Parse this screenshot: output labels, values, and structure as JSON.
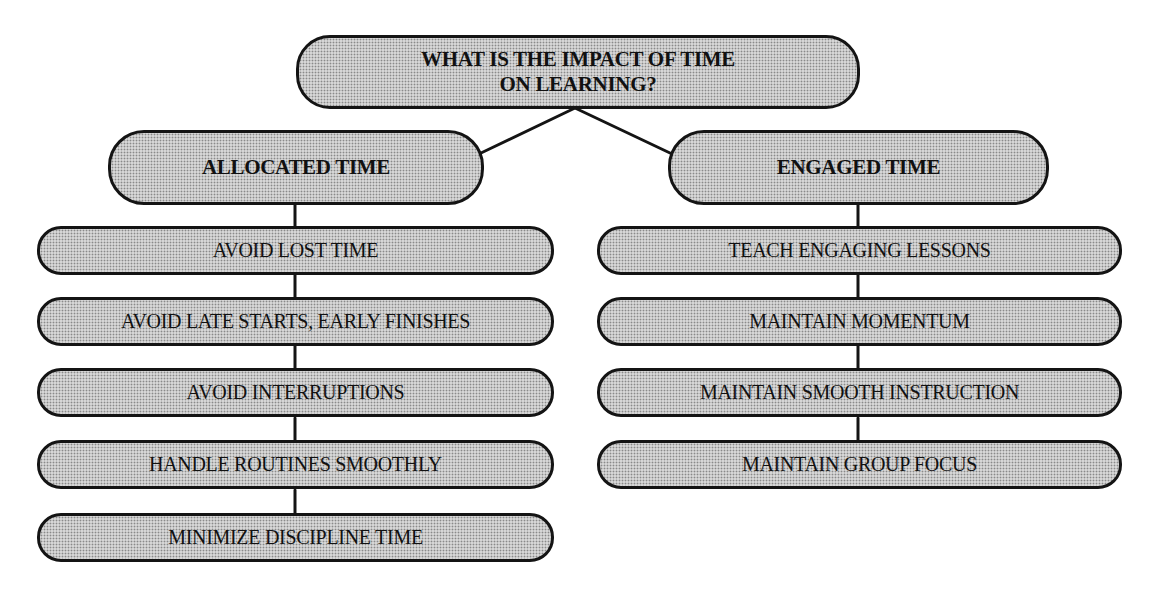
{
  "diagram": {
    "root": {
      "label_line1": "WHAT IS THE IMPACT OF TIME",
      "label_line2": "ON LEARNING?"
    },
    "branches": [
      {
        "label": "ALLOCATED TIME",
        "items": [
          "AVOID LOST TIME",
          "AVOID LATE STARTS, EARLY FINISHES",
          "AVOID INTERRUPTIONS",
          "HANDLE ROUTINES SMOOTHLY",
          "MINIMIZE DISCIPLINE TIME"
        ]
      },
      {
        "label": "ENGAGED TIME",
        "items": [
          "TEACH ENGAGING LESSONS",
          "MAINTAIN MOMENTUM",
          "MAINTAIN SMOOTH INSTRUCTION",
          "MAINTAIN GROUP FOCUS"
        ]
      }
    ],
    "colors": {
      "node_fill": "#d6d6d6",
      "node_border": "#141414",
      "connector": "#141414",
      "background": "#ffffff"
    }
  }
}
